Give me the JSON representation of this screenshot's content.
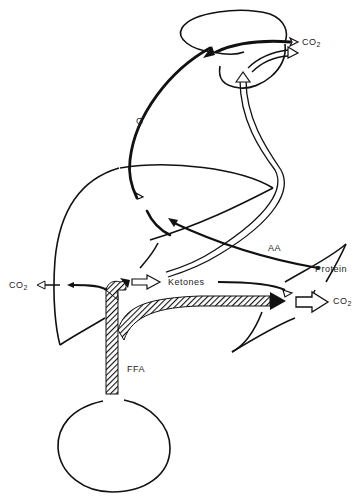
{
  "diagram": {
    "type": "metabolic-flow",
    "organs": [
      "brain",
      "liver",
      "muscle",
      "adipose-tissue"
    ],
    "labels": {
      "co2_brain": "CO",
      "co2_liver": "CO",
      "co2_muscle": "CO",
      "subscript_2": "2",
      "glucose": "G",
      "amino_acids": "AA",
      "protein": "Protein",
      "ketones": "Ketones",
      "ffa": "FFA"
    },
    "flows": [
      {
        "from": "liver",
        "to": "brain",
        "substance": "G",
        "style": "solid-thick"
      },
      {
        "from": "brain",
        "to": "CO2",
        "substance": "G",
        "style": "solid-thick"
      },
      {
        "from": "liver",
        "to": "brain",
        "substance": "Ketones",
        "style": "hollow"
      },
      {
        "from": "muscle",
        "to": "liver",
        "substance": "AA",
        "style": "solid"
      },
      {
        "from": "adipose-tissue",
        "to": "liver",
        "substance": "FFA",
        "style": "hatched"
      },
      {
        "from": "adipose-tissue",
        "to": "muscle",
        "substance": "FFA",
        "style": "hatched"
      },
      {
        "from": "liver",
        "to": "CO2",
        "substance": "FFA",
        "style": "solid"
      },
      {
        "from": "liver",
        "to": "muscle",
        "substance": "Ketones",
        "style": "solid"
      },
      {
        "from": "muscle",
        "to": "CO2",
        "substance": "mixed",
        "style": "hollow"
      }
    ],
    "colors": {
      "ink": "#111111",
      "background": "#ffffff"
    }
  }
}
